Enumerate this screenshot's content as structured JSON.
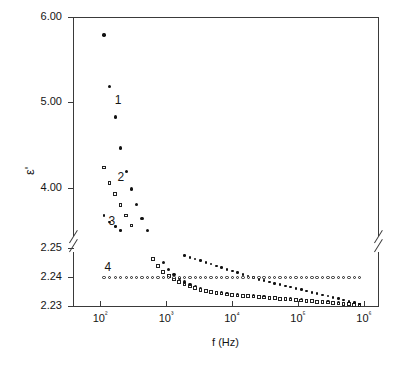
{
  "chart_data": {
    "type": "scatter",
    "title": "",
    "xlabel": "f (Hz)",
    "ylabel": "ε'",
    "xscale": "log",
    "xlim": [
      60,
      1000000
    ],
    "xticks": [
      100,
      1000,
      10000,
      100000,
      1000000
    ],
    "xticklabels": [
      "10²",
      "10³",
      "10⁴",
      "10⁵",
      "10⁶"
    ],
    "yticks_upper": [
      6.0,
      5.0,
      4.0
    ],
    "yticklabels_upper": [
      "6.00",
      "5.00",
      "4.00"
    ],
    "yticks_lower": [
      2.25,
      2.24,
      2.23
    ],
    "yticklabels_lower": [
      "2.25",
      "2.24",
      "2.23"
    ],
    "axis_break": true,
    "grid": false,
    "legend": "inline-curve-numbers",
    "series": [
      {
        "name": "1",
        "label": "1",
        "marker": "filled-circle",
        "color": "#111111",
        "points": [
          [
            115,
            5.79
          ],
          [
            140,
            5.19
          ],
          [
            170,
            4.83
          ],
          [
            205,
            4.47
          ],
          [
            250,
            4.19
          ],
          [
            300,
            3.99
          ],
          [
            360,
            3.81
          ],
          [
            435,
            3.64
          ],
          [
            520,
            3.5
          ],
          [
            630,
            3.36
          ],
          [
            760,
            3.24
          ],
          [
            910,
            3.13
          ],
          [
            1100,
            3.05
          ],
          [
            1320,
            2.99
          ],
          [
            1590,
            2.94
          ],
          [
            1910,
            2.9
          ],
          [
            2300,
            2.87
          ],
          [
            2770,
            2.84
          ],
          [
            3330,
            2.82
          ],
          [
            4010,
            2.8
          ],
          [
            4820,
            2.79
          ],
          [
            5800,
            2.78
          ],
          [
            6980,
            2.77
          ],
          [
            8400,
            2.76
          ],
          [
            10100,
            2.755
          ],
          [
            12150,
            2.75
          ],
          [
            14600,
            2.745
          ],
          [
            17600,
            2.74
          ],
          [
            21200,
            2.735
          ],
          [
            25500,
            2.73
          ],
          [
            30700,
            2.725
          ],
          [
            36900,
            2.72
          ],
          [
            44400,
            2.715
          ],
          [
            53400,
            2.71
          ],
          [
            64300,
            2.705
          ],
          [
            77400,
            2.7
          ],
          [
            93100,
            2.695
          ],
          [
            112000,
            2.69
          ],
          [
            135000,
            2.685
          ],
          [
            162000,
            2.68
          ],
          [
            195000,
            2.675
          ],
          [
            235000,
            2.67
          ],
          [
            283000,
            2.665
          ],
          [
            340000,
            2.66
          ],
          [
            409000,
            2.655
          ],
          [
            492000,
            2.65
          ],
          [
            592000,
            2.645
          ],
          [
            712000,
            2.64
          ],
          [
            857000,
            2.635
          ]
        ]
      },
      {
        "name": "2",
        "label": "2",
        "marker": "open-square",
        "color": "#222222",
        "points": [
          [
            115,
            4.24
          ],
          [
            140,
            4.06
          ],
          [
            170,
            3.93
          ],
          [
            205,
            3.8
          ],
          [
            250,
            3.68
          ],
          [
            300,
            3.56
          ],
          [
            360,
            3.45
          ],
          [
            435,
            3.35
          ],
          [
            520,
            3.25
          ],
          [
            630,
            3.17
          ],
          [
            760,
            3.09
          ],
          [
            910,
            3.02
          ],
          [
            1100,
            2.97
          ],
          [
            1320,
            2.93
          ],
          [
            1590,
            2.9
          ],
          [
            1910,
            2.87
          ],
          [
            2300,
            2.85
          ],
          [
            2770,
            2.83
          ],
          [
            3330,
            2.81
          ],
          [
            4010,
            2.795
          ],
          [
            4820,
            2.785
          ],
          [
            5800,
            2.775
          ],
          [
            6980,
            2.765
          ],
          [
            8400,
            2.755
          ],
          [
            10100,
            2.75
          ],
          [
            12150,
            2.745
          ],
          [
            14600,
            2.74
          ],
          [
            17600,
            2.735
          ],
          [
            21200,
            2.73
          ],
          [
            25500,
            2.725
          ],
          [
            30700,
            2.72
          ],
          [
            36900,
            2.715
          ],
          [
            44400,
            2.71
          ],
          [
            53400,
            2.705
          ],
          [
            64300,
            2.7
          ],
          [
            77400,
            2.695
          ],
          [
            93100,
            2.69
          ],
          [
            112000,
            2.685
          ],
          [
            135000,
            2.68
          ],
          [
            162000,
            2.675
          ],
          [
            195000,
            2.67
          ],
          [
            235000,
            2.665
          ],
          [
            283000,
            2.66
          ],
          [
            340000,
            2.655
          ],
          [
            409000,
            2.65
          ],
          [
            492000,
            2.645
          ],
          [
            592000,
            2.64
          ],
          [
            712000,
            2.635
          ],
          [
            857000,
            2.63
          ]
        ]
      },
      {
        "name": "3",
        "label": "3",
        "marker": "filled-dot",
        "color": "#111111",
        "points": [
          [
            115,
            3.68
          ],
          [
            140,
            3.6
          ],
          [
            170,
            3.55
          ],
          [
            205,
            3.5
          ],
          [
            250,
            3.46
          ],
          [
            300,
            3.42
          ],
          [
            360,
            3.39
          ],
          [
            435,
            3.37
          ],
          [
            520,
            3.35
          ],
          [
            630,
            3.33
          ],
          [
            760,
            3.31
          ],
          [
            910,
            3.29
          ],
          [
            1100,
            3.27
          ],
          [
            1320,
            3.25
          ],
          [
            1590,
            3.23
          ],
          [
            1910,
            3.21
          ],
          [
            2300,
            3.19
          ],
          [
            2770,
            3.17
          ],
          [
            3330,
            3.15
          ],
          [
            4010,
            3.13
          ],
          [
            4820,
            3.11
          ],
          [
            5800,
            3.09
          ],
          [
            6980,
            3.07
          ],
          [
            8400,
            3.05
          ],
          [
            10100,
            3.03
          ],
          [
            12150,
            3.01
          ],
          [
            14600,
            2.99
          ],
          [
            17600,
            2.97
          ],
          [
            21200,
            2.95
          ],
          [
            25500,
            2.93
          ],
          [
            30700,
            2.915
          ],
          [
            36900,
            2.9
          ],
          [
            44400,
            2.885
          ],
          [
            53400,
            2.87
          ],
          [
            64300,
            2.855
          ],
          [
            77400,
            2.84
          ],
          [
            93100,
            2.825
          ],
          [
            112000,
            2.81
          ],
          [
            135000,
            2.795
          ],
          [
            162000,
            2.78
          ],
          [
            195000,
            2.765
          ],
          [
            235000,
            2.75
          ],
          [
            283000,
            2.735
          ],
          [
            340000,
            2.72
          ],
          [
            409000,
            2.705
          ],
          [
            492000,
            2.69
          ],
          [
            592000,
            2.675
          ],
          [
            712000,
            2.66
          ],
          [
            857000,
            2.645
          ]
        ]
      },
      {
        "name": "4",
        "label": "4",
        "marker": "open-circle",
        "color": "#222222",
        "constant_value": 2.2398,
        "points": [
          [
            115,
            2.2398
          ],
          [
            140,
            2.2398
          ],
          [
            170,
            2.2398
          ],
          [
            205,
            2.2398
          ],
          [
            250,
            2.2398
          ],
          [
            300,
            2.2398
          ],
          [
            360,
            2.2398
          ],
          [
            435,
            2.2398
          ],
          [
            520,
            2.2398
          ],
          [
            630,
            2.2398
          ],
          [
            760,
            2.2398
          ],
          [
            910,
            2.2398
          ],
          [
            1100,
            2.2398
          ],
          [
            1320,
            2.2398
          ],
          [
            1590,
            2.2398
          ],
          [
            1910,
            2.2398
          ],
          [
            2300,
            2.2398
          ],
          [
            2770,
            2.2398
          ],
          [
            3330,
            2.2398
          ],
          [
            4010,
            2.2398
          ],
          [
            4820,
            2.2398
          ],
          [
            5800,
            2.2398
          ],
          [
            6980,
            2.2398
          ],
          [
            8400,
            2.2398
          ],
          [
            10100,
            2.2398
          ],
          [
            12150,
            2.2398
          ],
          [
            14600,
            2.2398
          ],
          [
            17600,
            2.2398
          ],
          [
            21200,
            2.2398
          ],
          [
            25500,
            2.2398
          ],
          [
            30700,
            2.2398
          ],
          [
            36900,
            2.2398
          ],
          [
            44400,
            2.2398
          ],
          [
            53400,
            2.2398
          ],
          [
            64300,
            2.2398
          ],
          [
            77400,
            2.2398
          ],
          [
            93100,
            2.2398
          ],
          [
            112000,
            2.2398
          ],
          [
            135000,
            2.2398
          ],
          [
            162000,
            2.2398
          ],
          [
            195000,
            2.2398
          ],
          [
            235000,
            2.2398
          ],
          [
            283000,
            2.2398
          ],
          [
            340000,
            2.2398
          ],
          [
            409000,
            2.2398
          ],
          [
            492000,
            2.2398
          ],
          [
            592000,
            2.2398
          ],
          [
            712000,
            2.2398
          ],
          [
            857000,
            2.2398
          ]
        ]
      }
    ],
    "annotations": [
      {
        "text": "1",
        "x": 185,
        "y": 5.02
      },
      {
        "text": "2",
        "x": 205,
        "y": 4.12
      },
      {
        "text": "3",
        "x": 150,
        "y": 3.6
      },
      {
        "text": "4",
        "x": 130,
        "y": 2.2432
      }
    ]
  }
}
